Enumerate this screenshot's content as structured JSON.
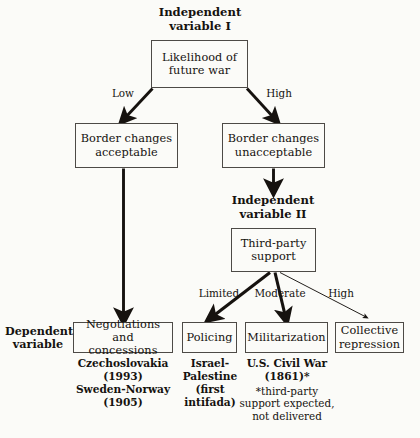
{
  "diagram": {
    "headings": {
      "iv1": "Independent\nvariable I",
      "iv2": "Independent\nvariable II",
      "dv": "Dependent\nvariable"
    },
    "nodes": {
      "likelihood": "Likelihood of\nfuture war",
      "border_acceptable": "Border changes\nacceptable",
      "border_unacceptable": "Border changes\nunacceptable",
      "third_party": "Third-party\nsupport",
      "negotiations": "Negotiations and\nconcessions",
      "policing": "Policing",
      "militarization": "Militarization",
      "collective": "Collective\nrepression"
    },
    "edge_labels": {
      "low": "Low",
      "high": "High",
      "limited": "Limited",
      "moderate": "Moderate",
      "high2": "High"
    },
    "captions": {
      "negotiations": "Czechoslovakia\n(1993)\nSweden-Norway\n(1905)",
      "policing": "Israel-\nPalestine\n(first\nintifada)",
      "militarization": "U.S. Civil War\n(1861)*",
      "militarization_note": "*third-party\nsupport expected,\nnot delivered"
    },
    "colors": {
      "background": "#fbfbf8",
      "ink": "#15120f",
      "box_border": "#4d4a46",
      "arrow": "#16120f"
    }
  }
}
